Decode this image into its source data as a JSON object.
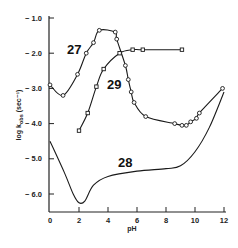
{
  "chart_data": {
    "type": "line",
    "title": "",
    "xlabel": "pH",
    "ylabel": "log k_obs (sec⁻¹)",
    "xlim": [
      0,
      12
    ],
    "ylim": [
      -6.5,
      -1.0
    ],
    "grid": false,
    "legend": "none (curves labeled inline)",
    "x_ticks": [
      "0",
      "2",
      "4",
      "6",
      "8",
      "10",
      "12"
    ],
    "y_ticks": [
      "-1.0",
      "-2.0",
      "-3.0",
      "-4.0",
      "-5.0",
      "-6.0"
    ],
    "series": [
      {
        "name": "27",
        "marker": "circle",
        "points": [
          {
            "x": 0.0,
            "y": -2.9
          },
          {
            "x": 0.9,
            "y": -3.2
          },
          {
            "x": 1.9,
            "y": -2.6
          },
          {
            "x": 2.5,
            "y": -2.0
          },
          {
            "x": 3.0,
            "y": -1.7
          },
          {
            "x": 3.4,
            "y": -1.35
          },
          {
            "x": 4.5,
            "y": -1.4
          },
          {
            "x": 4.6,
            "y": -1.6
          },
          {
            "x": 5.2,
            "y": -2.35
          },
          {
            "x": 5.4,
            "y": -2.75
          },
          {
            "x": 5.6,
            "y": -3.1
          },
          {
            "x": 5.8,
            "y": -3.4
          },
          {
            "x": 6.6,
            "y": -3.8
          },
          {
            "x": 8.6,
            "y": -4.0
          },
          {
            "x": 9.1,
            "y": -4.05
          },
          {
            "x": 9.4,
            "y": -4.05
          },
          {
            "x": 9.7,
            "y": -3.95
          },
          {
            "x": 10.1,
            "y": -3.85
          },
          {
            "x": 10.3,
            "y": -3.7
          },
          {
            "x": 11.9,
            "y": -3.0
          }
        ]
      },
      {
        "name": "29",
        "marker": "square",
        "points": [
          {
            "x": 2.0,
            "y": -4.2
          },
          {
            "x": 2.6,
            "y": -3.7
          },
          {
            "x": 3.2,
            "y": -2.95
          },
          {
            "x": 3.7,
            "y": -2.45
          },
          {
            "x": 4.8,
            "y": -2.0
          },
          {
            "x": 5.7,
            "y": -1.9
          },
          {
            "x": 6.4,
            "y": -1.9
          },
          {
            "x": 9.1,
            "y": -1.9
          }
        ]
      },
      {
        "name": "28",
        "marker": "none",
        "points": [
          {
            "x": 0.0,
            "y": -4.5
          },
          {
            "x": 1.0,
            "y": -5.4
          },
          {
            "x": 1.6,
            "y": -6.0
          },
          {
            "x": 2.0,
            "y": -6.25
          },
          {
            "x": 2.4,
            "y": -6.2
          },
          {
            "x": 3.0,
            "y": -5.75
          },
          {
            "x": 4.0,
            "y": -5.5
          },
          {
            "x": 6.0,
            "y": -5.35
          },
          {
            "x": 8.0,
            "y": -5.28
          },
          {
            "x": 9.0,
            "y": -5.2
          },
          {
            "x": 10.0,
            "y": -4.8
          },
          {
            "x": 11.0,
            "y": -4.1
          },
          {
            "x": 12.0,
            "y": -3.1
          }
        ]
      }
    ]
  },
  "labels": {
    "curve_27": "27",
    "curve_28": "28",
    "curve_29": "29",
    "x_axis_title": "pH",
    "y_axis_title": "log k",
    "y_axis_subscript": "obs",
    "y_axis_units": "(sec⁻¹)"
  }
}
